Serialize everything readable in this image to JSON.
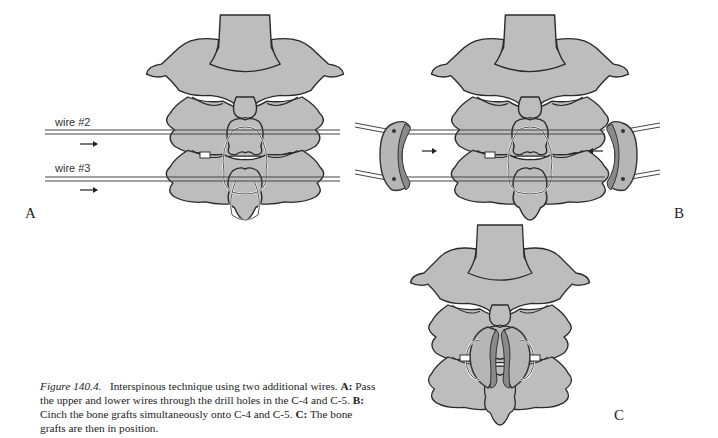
{
  "figure": {
    "number_label": "Figure 140.4.",
    "title": "Interspinous technique using two additional wires.",
    "parts": [
      {
        "letter": "A:",
        "text": "Pass the upper and lower wires through the drill holes in the C-4 and C-5."
      },
      {
        "letter": "B:",
        "text": "Cinch the bone grafts simultaneously onto C-4 and C-5."
      },
      {
        "letter": "C:",
        "text": "The bone grafts are then in position."
      }
    ]
  },
  "panels": {
    "A": {
      "letter": "A",
      "wire_labels": [
        "wire #2",
        "wire #3"
      ]
    },
    "B": {
      "letter": "B"
    },
    "C": {
      "letter": "C"
    }
  },
  "colors": {
    "bone": "#bdbdbd",
    "outline": "#2a2a2a",
    "background": "#ffffff"
  }
}
